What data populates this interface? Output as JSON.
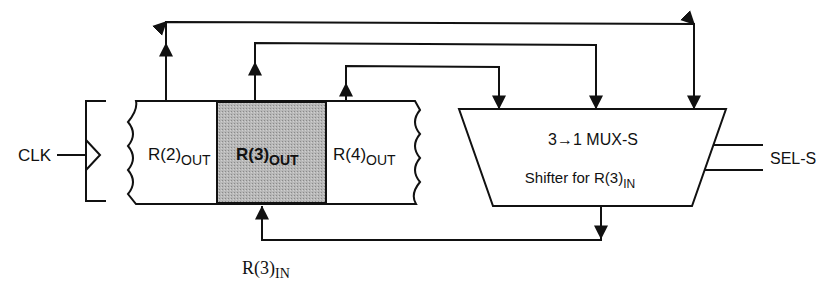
{
  "diagram": {
    "clock": {
      "label": "CLK"
    },
    "registers": [
      {
        "id": "r2",
        "label_main": "R(2)",
        "label_sub": "OUT",
        "highlighted": false
      },
      {
        "id": "r3",
        "label_main": "R(3)",
        "label_sub": "OUT",
        "highlighted": true
      },
      {
        "id": "r4",
        "label_main": "R(4)",
        "label_sub": "OUT",
        "highlighted": false
      }
    ],
    "mux": {
      "title": "3→1 MUX-S",
      "subtitle_main": "Shifter for R(3)",
      "subtitle_sub": "IN"
    },
    "select": {
      "label": "SEL-S"
    },
    "feedback": {
      "label_main": "R(3)",
      "label_sub": "IN"
    },
    "colors": {
      "line": "#111111",
      "highlight_fill": "#b4b4b4",
      "background": "#ffffff"
    }
  }
}
